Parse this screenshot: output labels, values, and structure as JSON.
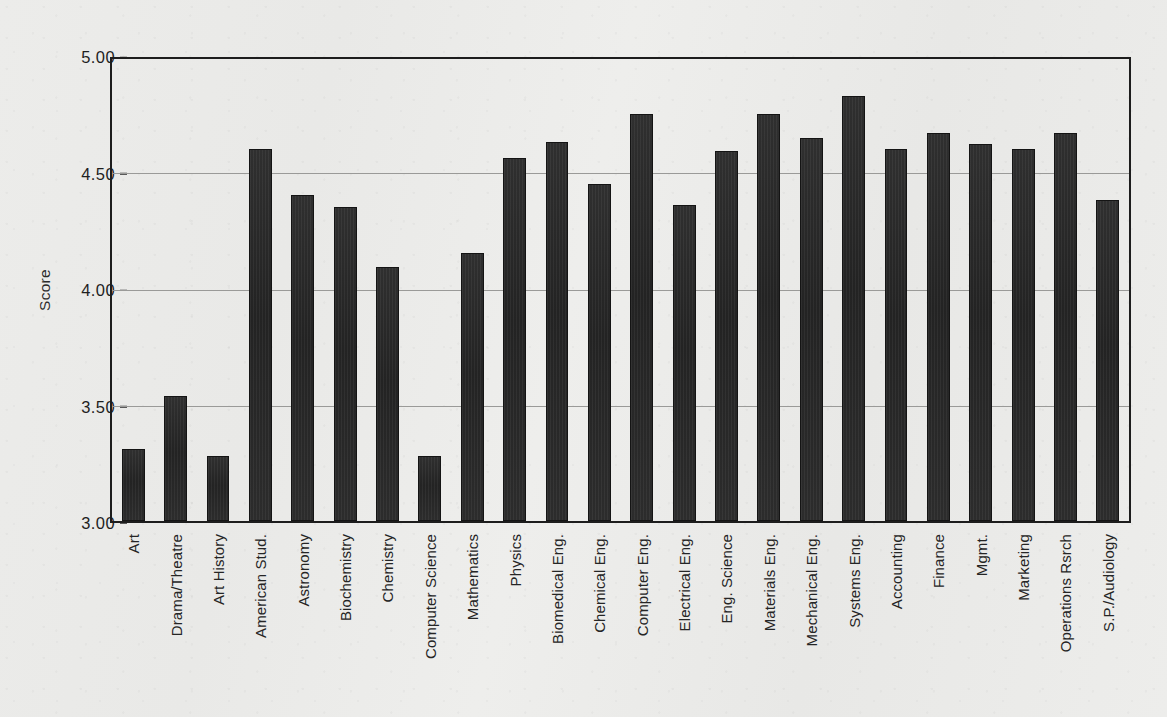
{
  "chart_data": {
    "type": "bar",
    "title": "",
    "subtitle": "",
    "xlabel": "",
    "ylabel": "Score",
    "ylim": [
      3.0,
      5.0
    ],
    "ytick_labels": [
      "5.00",
      "4.50",
      "4.00",
      "3.50",
      "3.00"
    ],
    "ytick_values": [
      5.0,
      4.5,
      4.0,
      3.5,
      3.0
    ],
    "grid": true,
    "gridlines_at": [
      4.5,
      4.0,
      3.5
    ],
    "legend": null,
    "legend_position": "none",
    "bar_color": "#2a2a2a",
    "background_color": "#e9e9e7",
    "categories": [
      "Art",
      "Drama/Theatre",
      "Art History",
      "American Stud.",
      "Astronomy",
      "Biochemistry",
      "Chemistry",
      "Computer Science",
      "Mathematics",
      "Physics",
      "Biomedical Eng.",
      "Chemical Eng.",
      "Computer Eng.",
      "Electrical Eng.",
      "Eng. Science",
      "Materials  Eng.",
      "Mechanical Eng.",
      "Systems Eng.",
      "Accounting",
      "Finance",
      "Mgmt.",
      "Marketing",
      "Operations Rsrch",
      "S.P./Audiology"
    ],
    "values": [
      3.31,
      3.54,
      3.28,
      4.61,
      4.41,
      4.36,
      4.1,
      3.28,
      4.16,
      4.57,
      4.64,
      4.46,
      4.76,
      4.37,
      4.6,
      4.76,
      4.66,
      4.84,
      4.61,
      4.68,
      4.63,
      4.61,
      4.68,
      4.39
    ]
  }
}
